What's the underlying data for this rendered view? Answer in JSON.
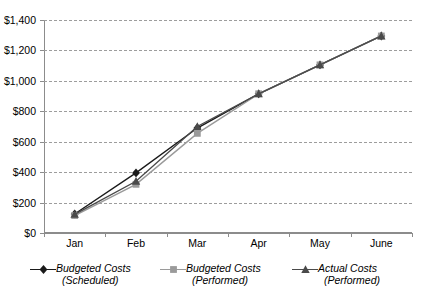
{
  "chart_data": {
    "type": "line",
    "title": "",
    "subtitle": "",
    "xlabel": "",
    "ylabel": "",
    "categories": [
      "Jan",
      "Feb",
      "Mar",
      "Apr",
      "May",
      "June"
    ],
    "ylim": [
      0,
      1400
    ],
    "ytick_step": 200,
    "ytick_labels": [
      "$0",
      "$200",
      "$400",
      "$600",
      "$800",
      "$1,000",
      "$1,200",
      "$1,400"
    ],
    "ytick_values": [
      0,
      200,
      400,
      600,
      800,
      1000,
      1200,
      1400
    ],
    "grid": true,
    "grid_style": "dashed-horizontal",
    "legend_position": "bottom",
    "series": [
      {
        "name": "Budgeted Costs (Scheduled)",
        "name_line1": "Budgeted Costs",
        "name_line2": "(Scheduled)",
        "marker": "diamond",
        "color": "#1a1a1a",
        "values": [
          125,
          395,
          690,
          915,
          1105,
          1295
        ]
      },
      {
        "name": "Budgeted Costs (Performed)",
        "name_line1": "Budgeted Costs",
        "name_line2": "(Performed)",
        "marker": "square",
        "color": "#9a9a9a",
        "values": [
          115,
          320,
          655,
          915,
          1105,
          1295
        ]
      },
      {
        "name": "Actual Costs (Performed)",
        "name_line1": "Actual Costs",
        "name_line2": "(Performed)",
        "marker": "triangle",
        "color": "#4a4a4a",
        "values": [
          122,
          340,
          700,
          915,
          1105,
          1295
        ]
      }
    ]
  },
  "axis": {
    "y_labels": [
      "$1,400",
      "$1,200",
      "$1,000",
      "$800",
      "$600",
      "$400",
      "$200",
      "$0"
    ],
    "x_labels": [
      "Jan",
      "Feb",
      "Mar",
      "Apr",
      "May",
      "June"
    ]
  },
  "legend": {
    "items": [
      {
        "line1": "Budgeted Costs",
        "line2": "(Scheduled)",
        "marker": "diamond-marker",
        "color": "#1a1a1a"
      },
      {
        "line1": "Budgeted Costs",
        "line2": "(Performed)",
        "marker": "square-marker",
        "color": "#9a9a9a"
      },
      {
        "line1": "Actual Costs",
        "line2": "(Performed)",
        "marker": "triangle-marker",
        "color": "#4a4a4a"
      }
    ]
  },
  "colors": {
    "grid": "#9d9d9d",
    "axis": "#8c8c8c",
    "text": "#000000",
    "background": "#ffffff"
  }
}
